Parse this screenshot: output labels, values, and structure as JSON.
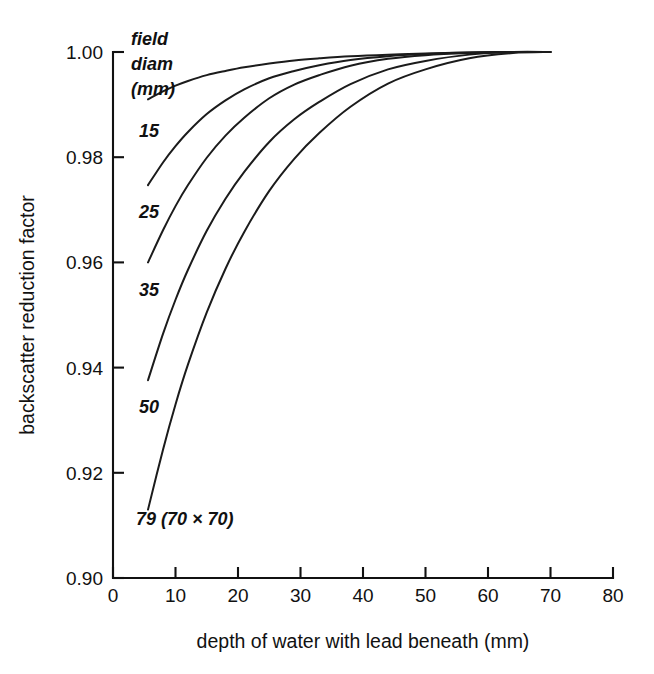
{
  "chart_data": {
    "type": "line",
    "title": "",
    "xlabel": "depth of water with lead beneath (mm)",
    "ylabel": "backscatter reduction factor",
    "xlim": [
      0,
      80
    ],
    "ylim": [
      0.9,
      1.0
    ],
    "xticks": [
      0,
      10,
      20,
      30,
      40,
      50,
      60,
      70,
      80
    ],
    "xtick_labels": [
      "0",
      "10",
      "20",
      "30",
      "40",
      "50",
      "60",
      "70",
      "80"
    ],
    "yticks": [
      0.9,
      0.92,
      0.94,
      0.96,
      0.98,
      1.0
    ],
    "ytick_labels": [
      "0.90",
      "0.92",
      "0.94",
      "0.96",
      "0.98",
      "1.00"
    ],
    "grid": false,
    "legend_position": "inline-curve-labels",
    "legend_header": [
      "field",
      "diam",
      "(mm)"
    ],
    "line_color": "#1b1b1b",
    "background_color": "#ffffff",
    "series": [
      {
        "name": "15",
        "label": "15",
        "x": [
          5.6,
          8,
          10,
          12,
          15,
          18,
          21,
          25,
          29,
          33,
          38,
          44,
          50,
          57,
          64,
          70
        ],
        "values": [
          0.991,
          0.9925,
          0.9936,
          0.9945,
          0.9956,
          0.9964,
          0.9971,
          0.9978,
          0.9984,
          0.9988,
          0.9992,
          0.9995,
          0.9997,
          0.9999,
          1.0,
          1.0
        ]
      },
      {
        "name": "25",
        "label": "25",
        "x": [
          5.6,
          8,
          10,
          12,
          15,
          18,
          21,
          25,
          29,
          33,
          38,
          44,
          50,
          57,
          64,
          70
        ],
        "values": [
          0.9747,
          0.979,
          0.9821,
          0.9848,
          0.9882,
          0.9908,
          0.9929,
          0.995,
          0.9964,
          0.9975,
          0.9985,
          0.9992,
          0.9996,
          0.9999,
          1.0,
          1.0
        ]
      },
      {
        "name": "35",
        "label": "35",
        "x": [
          5.6,
          8,
          10,
          12,
          15,
          18,
          21,
          25,
          29,
          33,
          38,
          44,
          50,
          57,
          64,
          70
        ],
        "values": [
          0.96,
          0.9661,
          0.9707,
          0.9747,
          0.9799,
          0.9841,
          0.9875,
          0.9912,
          0.9938,
          0.9956,
          0.9974,
          0.9987,
          0.9994,
          0.9998,
          1.0,
          1.0
        ]
      },
      {
        "name": "50",
        "label": "50",
        "x": [
          5.6,
          8,
          10,
          12,
          15,
          18,
          21,
          25,
          29,
          33,
          38,
          44,
          50,
          57,
          64,
          70
        ],
        "values": [
          0.9376,
          0.9464,
          0.9529,
          0.9586,
          0.966,
          0.9721,
          0.9772,
          0.9829,
          0.9872,
          0.9905,
          0.9939,
          0.9967,
          0.9983,
          0.9995,
          1.0,
          1.0
        ]
      },
      {
        "name": "79",
        "label": "79 (70 × 70)",
        "x": [
          5.6,
          8,
          10,
          12,
          15,
          18,
          21,
          25,
          29,
          33,
          38,
          44,
          50,
          57,
          64,
          70
        ],
        "values": [
          0.913,
          0.9244,
          0.933,
          0.9406,
          0.9505,
          0.9588,
          0.9658,
          0.9736,
          0.9797,
          0.9846,
          0.9896,
          0.994,
          0.9967,
          0.9988,
          0.9998,
          1.0
        ]
      }
    ]
  },
  "annotations": {
    "legend_line1": "field",
    "legend_line2": "diam",
    "legend_line3": "(mm)",
    "curve_label_15": "15",
    "curve_label_25": "25",
    "curve_label_35": "35",
    "curve_label_50": "50",
    "curve_label_79": "79 (70 × 70)"
  }
}
